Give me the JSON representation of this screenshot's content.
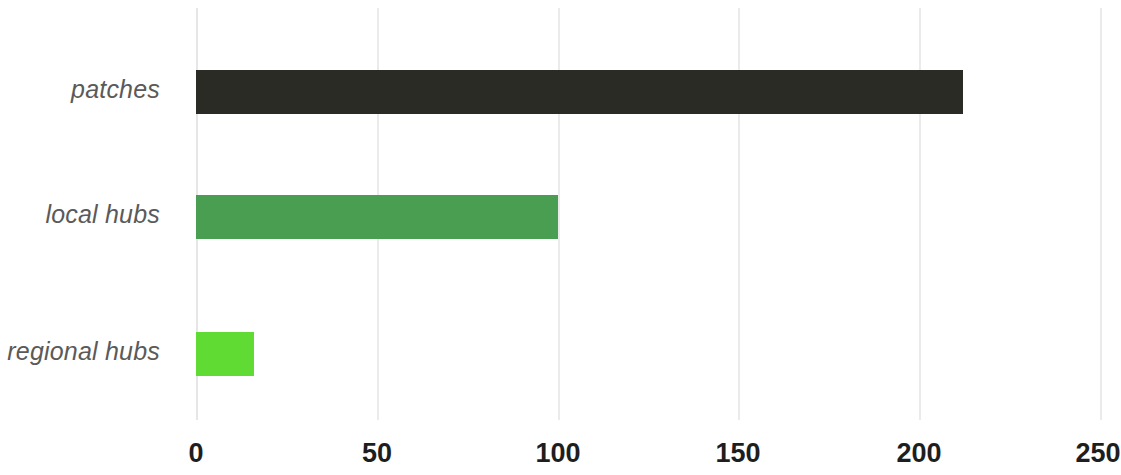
{
  "chart_data": {
    "type": "bar",
    "orientation": "horizontal",
    "title": "",
    "subtitle": "",
    "xlabel": "",
    "ylabel": "",
    "categories": [
      "patches",
      "local hubs",
      "regional hubs"
    ],
    "values": [
      212,
      100,
      16
    ],
    "series": [
      {
        "name": "count",
        "values": [
          212,
          100,
          16
        ]
      }
    ],
    "bar_colors": [
      "#2b2b26",
      "#4a9e51",
      "#5fdb33"
    ],
    "xlim": [
      0,
      250
    ],
    "ylim": null,
    "xticks": [
      0,
      50,
      100,
      150,
      200,
      250
    ],
    "xtick_labels": [
      "0",
      "50",
      "100",
      "150",
      "200",
      "250"
    ],
    "yticks": [
      "patches",
      "local hubs",
      "regional hubs"
    ],
    "grid": "vertical-only",
    "gridline_color": "#ebebeb",
    "legend": null,
    "legend_position": "none",
    "annotations": [],
    "background_color": "#ffffff"
  },
  "axis": {
    "x": {
      "ticks": [
        {
          "value": 0,
          "label": "0"
        },
        {
          "value": 50,
          "label": "50"
        },
        {
          "value": 100,
          "label": "100"
        },
        {
          "value": 150,
          "label": "150"
        },
        {
          "value": 200,
          "label": "200"
        },
        {
          "value": 250,
          "label": "250"
        }
      ]
    },
    "y": {
      "categories": [
        {
          "label": "patches"
        },
        {
          "label": "local hubs"
        },
        {
          "label": "regional hubs"
        }
      ]
    }
  },
  "bars": [
    {
      "label": "patches",
      "value": 212,
      "color": "#2b2b26"
    },
    {
      "label": "local hubs",
      "value": 100,
      "color": "#4a9e51"
    },
    {
      "label": "regional hubs",
      "value": 16,
      "color": "#5fdb33"
    }
  ]
}
